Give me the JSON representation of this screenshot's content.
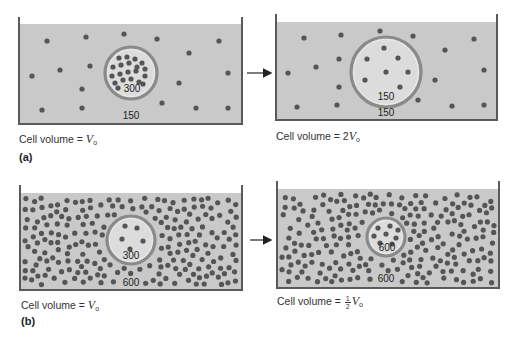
{
  "colors": {
    "water": "#c9c9c9",
    "water_edge": "#bdbdbd",
    "wall": "#5a5a5a",
    "particle": "#555555",
    "cell_fill": "#dcdcdc",
    "membrane": "#8a8a8a",
    "arrow": "#222222",
    "text": "#333333"
  },
  "panels": [
    {
      "id": "a",
      "tag": "(a)",
      "before": {
        "container": {
          "x": 19,
          "y": 17,
          "w": 223,
          "water_top": 24,
          "bottom": 124
        },
        "cell": {
          "cx": 131,
          "cy": 73,
          "r": 26
        },
        "cell_conc_label": "300",
        "outside_conc_label": "150",
        "outside_conc_pos": {
          "x": 131,
          "y": 119
        },
        "cell_conc_pos": {
          "x": 132,
          "y": 92
        },
        "caption_prefix": "Cell volume = ",
        "caption_var": "V",
        "caption_sub": "o",
        "caption_coef": "",
        "outside_particles": [
          [
            47,
            41
          ],
          [
            86,
            37
          ],
          [
            124,
            34
          ],
          [
            157,
            39
          ],
          [
            219,
            41
          ],
          [
            189,
            53
          ],
          [
            32,
            76
          ],
          [
            60,
            70
          ],
          [
            90,
            66
          ],
          [
            179,
            83
          ],
          [
            228,
            73
          ],
          [
            82,
            89
          ],
          [
            42,
            110
          ],
          [
            82,
            108
          ],
          [
            162,
            103
          ],
          [
            196,
            108
          ],
          [
            228,
            108
          ]
        ],
        "inside_particles": [
          [
            119,
            58
          ],
          [
            127,
            57
          ],
          [
            135,
            59
          ],
          [
            142,
            63
          ],
          [
            113,
            67
          ],
          [
            121,
            65
          ],
          [
            129,
            63
          ],
          [
            137,
            67
          ],
          [
            145,
            69
          ],
          [
            112,
            76
          ],
          [
            120,
            74
          ],
          [
            128,
            72
          ],
          [
            136,
            71
          ],
          [
            145,
            76
          ],
          [
            115,
            83
          ],
          [
            123,
            80
          ],
          [
            131,
            79
          ],
          [
            139,
            82
          ],
          [
            118,
            88
          ],
          [
            143,
            84
          ]
        ]
      },
      "after": {
        "container": {
          "x": 276,
          "y": 14,
          "w": 221,
          "water_top": 22,
          "bottom": 120
        },
        "cell": {
          "cx": 386,
          "cy": 72,
          "r": 35
        },
        "cell_conc_label": "150",
        "outside_conc_label": "150",
        "outside_conc_pos": {
          "x": 386,
          "y": 116
        },
        "cell_conc_pos": {
          "x": 386,
          "y": 100
        },
        "caption_prefix": "Cell volume = ",
        "caption_var": "V",
        "caption_sub": "o",
        "caption_coef": "2",
        "outside_particles": [
          [
            304,
            38
          ],
          [
            341,
            35
          ],
          [
            380,
            31
          ],
          [
            413,
            36
          ],
          [
            474,
            39
          ],
          [
            445,
            50
          ],
          [
            288,
            73
          ],
          [
            316,
            67
          ],
          [
            339,
            59
          ],
          [
            339,
            87
          ],
          [
            435,
            80
          ],
          [
            484,
            70
          ],
          [
            297,
            107
          ],
          [
            337,
            105
          ],
          [
            418,
            100
          ],
          [
            452,
            106
          ],
          [
            484,
            105
          ]
        ],
        "inside_particles": [
          [
            384,
            48
          ],
          [
            367,
            59
          ],
          [
            398,
            58
          ],
          [
            386,
            72
          ],
          [
            408,
            72
          ],
          [
            365,
            80
          ],
          [
            400,
            87
          ]
        ]
      },
      "arrow": {
        "x1": 247,
        "y1": 73,
        "x2": 270,
        "y2": 73
      }
    },
    {
      "id": "b",
      "tag": "(b)",
      "before": {
        "container": {
          "x": 20,
          "y": 185,
          "w": 222,
          "water_top": 193,
          "bottom": 290
        },
        "cell": {
          "cx": 131,
          "cy": 240,
          "r": 24
        },
        "cell_conc_label": "300",
        "outside_conc_label": "600",
        "outside_conc_pos": {
          "x": 131,
          "y": 286
        },
        "cell_conc_pos": {
          "x": 131,
          "y": 259
        },
        "caption_prefix": "Cell volume = ",
        "caption_var": "V",
        "caption_sub": "o",
        "caption_coef": "",
        "density": "high",
        "seed": 7,
        "n_outside": 210,
        "inside_particles": [
          [
            125,
            226
          ],
          [
            137,
            228
          ],
          [
            122,
            239
          ],
          [
            143,
            241
          ],
          [
            130,
            249
          ]
        ]
      },
      "after": {
        "container": {
          "x": 277,
          "y": 181,
          "w": 222,
          "water_top": 189,
          "bottom": 288
        },
        "cell": {
          "cx": 386,
          "cy": 237,
          "r": 19
        },
        "cell_conc_label": "600",
        "outside_conc_label": "600",
        "outside_conc_pos": {
          "x": 386,
          "y": 282
        },
        "cell_conc_pos": {
          "x": 387,
          "y": 251
        },
        "caption_prefix": "Cell volume = ",
        "caption_var": "V",
        "caption_sub": "o",
        "caption_coef": "",
        "caption_frac": {
          "num": "1",
          "den": "2"
        },
        "density": "high",
        "seed": 13,
        "n_outside": 215,
        "inside_particles": [
          [
            378,
            228
          ],
          [
            390,
            226
          ],
          [
            398,
            230
          ],
          [
            374,
            236
          ],
          [
            386,
            234
          ],
          [
            396,
            238
          ],
          [
            380,
            243
          ],
          [
            392,
            244
          ]
        ]
      },
      "arrow": {
        "x1": 250,
        "y1": 240,
        "x2": 270,
        "y2": 240
      }
    }
  ],
  "captions": {
    "a_before": {
      "x": 19,
      "y": 132
    },
    "a_after": {
      "x": 276,
      "y": 129
    },
    "a_tag": {
      "x": 19,
      "y": 151
    },
    "b_before": {
      "x": 21,
      "y": 298
    },
    "b_after": {
      "x": 277,
      "y": 294
    },
    "b_tag": {
      "x": 21,
      "y": 315
    }
  }
}
